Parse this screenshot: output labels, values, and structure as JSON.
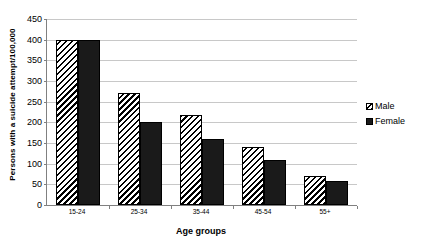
{
  "chart_data": {
    "type": "bar",
    "title": "",
    "xlabel": "Age groups",
    "ylabel": "Persons with a suicide attempt/100,000",
    "categories": [
      "15-24",
      "25-34",
      "35-44",
      "45-54",
      "55+"
    ],
    "series": [
      {
        "name": "Male",
        "values": [
          400,
          270,
          218,
          140,
          70
        ],
        "pattern": "diagonal-hatch",
        "color": "#ffffff"
      },
      {
        "name": "Female",
        "values": [
          400,
          200,
          160,
          110,
          58
        ],
        "pattern": "solid",
        "color": "#1a1a1a"
      }
    ],
    "ylim": [
      0,
      450
    ],
    "ytick_step": 50,
    "yticks": [
      0,
      50,
      100,
      150,
      200,
      250,
      300,
      350,
      400,
      450
    ],
    "grid": "horizontal",
    "legend_position": "right"
  },
  "legend": {
    "entries": [
      {
        "label": "Male",
        "swatch": "hatched-swatch-icon"
      },
      {
        "label": "Female",
        "swatch": "solid-black-swatch-icon"
      }
    ]
  }
}
